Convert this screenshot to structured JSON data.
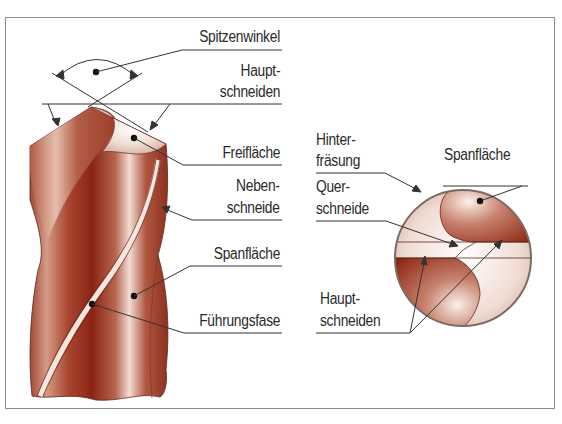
{
  "figure": {
    "colors": {
      "frame": "#8d8d8d",
      "drill_dark": "#8e2a18",
      "drill_mid": "#b8644e",
      "drill_light": "#f3dfd6",
      "leader": "#333333",
      "text": "#2a2a2a"
    }
  },
  "side_view": {
    "labels": {
      "spitzenwinkel": "Spitzenwinkel",
      "hauptschneiden_1": "Haupt-",
      "hauptschneiden_2": "schneiden",
      "freiflaeche": "Freifläche",
      "nebenschneide_1": "Neben-",
      "nebenschneide_2": "schneide",
      "spanflaeche": "Spanfläche",
      "fuehrungsfase": "Führungsfase"
    }
  },
  "end_view": {
    "labels": {
      "hinterfraesung_1": "Hinter-",
      "hinterfraesung_2": "fräsung",
      "spanflaeche": "Spanfläche",
      "querschneide_1": "Quer-",
      "querschneide_2": "schneide",
      "hauptschneiden_1": "Haupt-",
      "hauptschneiden_2": "schneiden"
    }
  }
}
